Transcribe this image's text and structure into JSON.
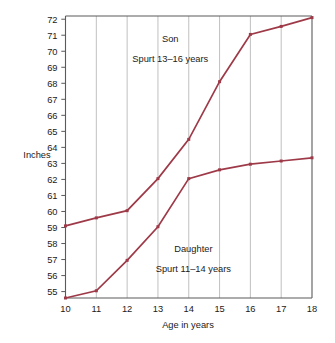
{
  "chart_data": {
    "type": "line",
    "title": "",
    "xlabel": "Age in years",
    "ylabel": "Inches",
    "xlim": [
      10,
      18
    ],
    "ylim": [
      54.6,
      72.2
    ],
    "grid": "vertical",
    "legend": "none",
    "x": [
      10,
      11,
      12,
      13,
      14,
      15,
      16,
      17,
      18
    ],
    "xticklabels": [
      "10",
      "11",
      "12",
      "13",
      "14",
      "15",
      "16",
      "17",
      "18"
    ],
    "yticks": [
      55,
      56,
      57,
      58,
      59,
      60,
      61,
      62,
      63,
      64,
      65,
      66,
      67,
      68,
      69,
      70,
      71,
      72
    ],
    "yticklabels": [
      "55",
      "56",
      "57",
      "58",
      "59",
      "60",
      "61",
      "62",
      "63",
      "64",
      "65",
      "66",
      "67",
      "68",
      "69",
      "70",
      "71",
      "72"
    ],
    "series": [
      {
        "name": "Son",
        "color": "#9e3a48",
        "values": [
          59.1,
          59.6,
          60.05,
          62.05,
          64.5,
          68.1,
          71.05,
          71.55,
          72.1
        ]
      },
      {
        "name": "Daughter",
        "color": "#9e3a48",
        "values": [
          54.6,
          55.05,
          56.95,
          59.05,
          62.05,
          62.6,
          62.95,
          63.15,
          63.35
        ]
      }
    ],
    "annotations": [
      {
        "name": "son-label",
        "text": "Son",
        "x": 13.4,
        "y": 70.6
      },
      {
        "name": "son-spurt-label",
        "text": "Spurt 13–16 years",
        "x": 13.4,
        "y": 69.35
      },
      {
        "name": "daughter-label",
        "text": "Daughter",
        "x": 14.15,
        "y": 57.45
      },
      {
        "name": "daughter-spurt-label",
        "text": "Spurt 11–14 years",
        "x": 14.15,
        "y": 56.2
      }
    ]
  },
  "axes": {
    "y_axis_title": "Inches",
    "x_axis_title": "Age in years"
  }
}
